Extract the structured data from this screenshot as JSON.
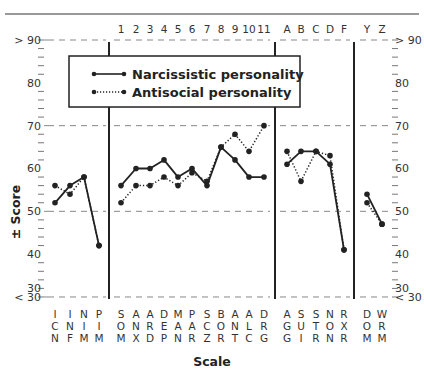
{
  "chart_data": {
    "type": "line",
    "title": "",
    "xlabel": "Scale",
    "ylabel": "± Score",
    "ylim": [
      30,
      90
    ],
    "y_ticks_labeled": [
      "> 90",
      "80",
      "70",
      "60",
      "50",
      "40",
      "30",
      "< 30"
    ],
    "grid": "dashed reference lines at 90, 70, 50, 30",
    "legend_position": "top-left inside plot",
    "panels": [
      {
        "name": "validity",
        "top_labels": [
          "",
          "",
          "",
          ""
        ],
        "categories": [
          "ICN",
          "INF",
          "NIM",
          "PIM"
        ],
        "series": [
          {
            "name": "Narcissistic personality",
            "style": "solid",
            "values": [
              52,
              56,
              58,
              42
            ]
          },
          {
            "name": "Antisocial personality",
            "style": "dotted",
            "values": [
              56,
              54,
              58,
              42
            ]
          }
        ]
      },
      {
        "name": "clinical",
        "top_labels": [
          "1",
          "2",
          "3",
          "4",
          "5",
          "6",
          "7",
          "8",
          "9",
          "10",
          "11"
        ],
        "categories": [
          "SOM",
          "ANX",
          "ARD",
          "DEP",
          "MAN",
          "PAR",
          "SCZ",
          "BOR",
          "ANT",
          "ALC",
          "DRG"
        ],
        "series": [
          {
            "name": "Narcissistic personality",
            "style": "solid",
            "values": [
              56,
              60,
              60,
              62,
              58,
              60,
              56,
              65,
              62,
              58,
              58
            ]
          },
          {
            "name": "Antisocial personality",
            "style": "dotted",
            "values": [
              52,
              56,
              56,
              58,
              56,
              59,
              57,
              65,
              68,
              64,
              70
            ]
          }
        ]
      },
      {
        "name": "treatment",
        "top_labels": [
          "A",
          "B",
          "C",
          "D",
          "F"
        ],
        "categories": [
          "AGG",
          "SUI",
          "STR",
          "NON",
          "RXR"
        ],
        "series": [
          {
            "name": "Narcissistic personality",
            "style": "solid",
            "values": [
              61,
              64,
              64,
              61,
              41
            ]
          },
          {
            "name": "Antisocial personality",
            "style": "dotted",
            "values": [
              64,
              57,
              64,
              63,
              41
            ]
          }
        ]
      },
      {
        "name": "interpersonal",
        "top_labels": [
          "Y",
          "Z"
        ],
        "categories": [
          "DOM",
          "WRM"
        ],
        "series": [
          {
            "name": "Narcissistic personality",
            "style": "solid",
            "values": [
              54,
              47
            ]
          },
          {
            "name": "Antisocial personality",
            "style": "dotted",
            "values": [
              52,
              47
            ]
          }
        ]
      }
    ]
  },
  "legend": {
    "items": [
      {
        "label": "Narcissistic personality",
        "style": "solid"
      },
      {
        "label": "Antisocial personality",
        "style": "dotted"
      }
    ]
  },
  "axis": {
    "ylabel": "± Score",
    "xlabel": "Scale",
    "left_labels": [
      "> 90",
      "80",
      "70",
      "60",
      "50",
      "40",
      "30",
      "< 30"
    ],
    "right_labels": [
      "> 90",
      "80",
      "70",
      "60",
      "50",
      "40",
      "30",
      "< 30"
    ]
  },
  "colors": {
    "line": "#222222",
    "grid": "#888888",
    "text": "#333333"
  }
}
